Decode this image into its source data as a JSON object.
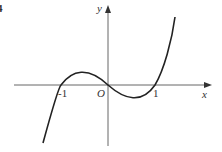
{
  "figure": {
    "number_label": "4",
    "x_axis_label": "x",
    "y_axis_label": "y",
    "origin_label": "O",
    "tick_labels": [
      "-1",
      "1"
    ],
    "curve": "cubic y = x^3 - x, roots at -1, 0, 1"
  }
}
